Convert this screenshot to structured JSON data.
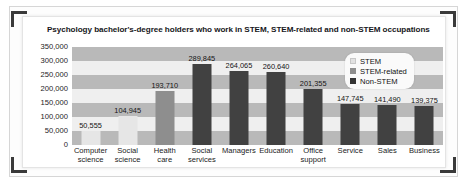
{
  "chart_data": {
    "type": "bar",
    "title": "Psychology bachelor's-degree holders who work in STEM, STEM-related and non-STEM occupations",
    "xlabel": "",
    "ylabel": "",
    "ylim": [
      0,
      350000
    ],
    "grid": "horizontal-bands",
    "legend_position": "top-right",
    "categories": [
      "Computer science",
      "Social science",
      "Health care",
      "Social services",
      "Managers",
      "Education",
      "Office support",
      "Service",
      "Sales",
      "Business"
    ],
    "category_lines": [
      [
        "Computer",
        "science"
      ],
      [
        "Social",
        "science"
      ],
      [
        "Health",
        "care"
      ],
      [
        "Social",
        "services"
      ],
      [
        "Managers",
        ""
      ],
      [
        "Education",
        ""
      ],
      [
        "Office",
        "support"
      ],
      [
        "Service",
        ""
      ],
      [
        "Sales",
        ""
      ],
      [
        "Business",
        ""
      ]
    ],
    "values": [
      50555,
      104945,
      193710,
      289845,
      264065,
      260640,
      201355,
      147745,
      141490,
      139375
    ],
    "value_labels": [
      "50,555",
      "104,945",
      "193,710",
      "289,845",
      "264,065",
      "260,640",
      "201,355",
      "147,745",
      "141,490",
      "139,375"
    ],
    "series_of_bar": [
      "STEM",
      "STEM",
      "STEM-related",
      "Non-STEM",
      "Non-STEM",
      "Non-STEM",
      "Non-STEM",
      "Non-STEM",
      "Non-STEM",
      "Non-STEM"
    ],
    "ytick_labels": [
      "350,000",
      "300,000",
      "250,000",
      "200,000",
      "150,000",
      "100,000",
      "50,000",
      "0"
    ],
    "ytick_values": [
      350000,
      300000,
      250000,
      200000,
      150000,
      100000,
      50000,
      0
    ],
    "legend": [
      {
        "label": "STEM",
        "color": "#e2e2e2"
      },
      {
        "label": "STEM-related",
        "color": "#8e8e8e"
      },
      {
        "label": "Non-STEM",
        "color": "#333333"
      }
    ]
  }
}
